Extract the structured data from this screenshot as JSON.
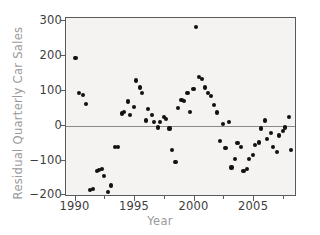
{
  "chart_data": {
    "type": "scatter",
    "title": "",
    "xlabel": "Year",
    "ylabel": "Residual Quarterly Car Sales",
    "xlim": [
      1989.2,
      2008.6
    ],
    "ylim": [
      -205,
      310
    ],
    "xticks": [
      1990,
      1995,
      2000,
      2005
    ],
    "xtick_labels": [
      "1990",
      "1995",
      "2000",
      "2005"
    ],
    "yticks": [
      -200,
      -100,
      0,
      100,
      200,
      300
    ],
    "ytick_labels": [
      "-200",
      "-100",
      "0",
      "100",
      "200",
      "300"
    ],
    "grid": false,
    "legend": null,
    "reference_lines": [
      {
        "axis": "y",
        "value": 0,
        "color": "#8a8a8a"
      }
    ],
    "marker": {
      "shape": "circle",
      "color": "#111111",
      "size": 4
    },
    "series": [
      {
        "name": "Residual Quarterly Car Sales",
        "x": [
          1990.0,
          1990.3,
          1990.6,
          1990.9,
          1991.2,
          1991.5,
          1991.8,
          1992.0,
          1992.2,
          1992.4,
          1992.7,
          1993.0,
          1993.3,
          1993.6,
          1993.9,
          1994.1,
          1994.4,
          1994.6,
          1994.9,
          1995.1,
          1995.4,
          1995.6,
          1995.9,
          1996.1,
          1996.4,
          1996.6,
          1996.9,
          1997.1,
          1997.4,
          1997.6,
          1997.9,
          1998.1,
          1998.4,
          1998.6,
          1998.9,
          1999.1,
          1999.4,
          1999.6,
          1999.9,
          2000.1,
          2000.4,
          2000.6,
          2000.9,
          2001.1,
          2001.4,
          2001.6,
          2001.9,
          2002.1,
          2002.4,
          2002.6,
          2002.9,
          2003.1,
          2003.4,
          2003.6,
          2003.9,
          2004.1,
          2004.4,
          2004.6,
          2004.9,
          2005.1,
          2005.4,
          2005.6,
          2005.9,
          2006.1,
          2006.4,
          2006.6,
          2006.9,
          2007.1,
          2007.4,
          2007.6,
          2007.9,
          2008.1
        ],
        "y": [
          196,
          95,
          88,
          62,
          -185,
          -182,
          -130,
          -128,
          -124,
          -145,
          -190,
          -172,
          -60,
          -62,
          35,
          40,
          70,
          30,
          55,
          130,
          110,
          95,
          15,
          48,
          30,
          10,
          -5,
          10,
          25,
          20,
          -8,
          -70,
          -105,
          50,
          75,
          72,
          95,
          40,
          105,
          285,
          140,
          135,
          110,
          95,
          85,
          60,
          38,
          -45,
          5,
          -65,
          10,
          -120,
          -95,
          -50,
          -60,
          -130,
          -125,
          -95,
          -85,
          -55,
          -48,
          -8,
          15,
          -38,
          -20,
          -62,
          -75,
          -28,
          -15,
          -5,
          25,
          -70
        ]
      }
    ]
  },
  "axis_title_color": "#9a9a9a",
  "tick_label_color": "#3d3d3d"
}
